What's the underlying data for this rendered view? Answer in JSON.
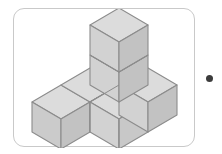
{
  "figure": {
    "caption": "Solid figure built from unit cubes",
    "cube_count_total": 7,
    "base_layer_cubes": 5,
    "tower_cubes": 2,
    "tower_height_levels": 2,
    "colors": {
      "top_face": "#dcdcdc",
      "left_face": "#cbcbcb",
      "right_face": "#c2c2c2",
      "front_face": "#d2d2d2",
      "edge_stroke": "#8c8c8c",
      "frame_border": "#c9c9c9",
      "background": "#ffffff",
      "bullet": "#3c3c3c"
    },
    "frame": {
      "x": 13,
      "y": 8,
      "width": 182,
      "height": 139,
      "corner_radius": 11
    },
    "bullet": {
      "name": "answer-bullet",
      "x": 210,
      "y": 79,
      "radius": 3.5
    }
  }
}
